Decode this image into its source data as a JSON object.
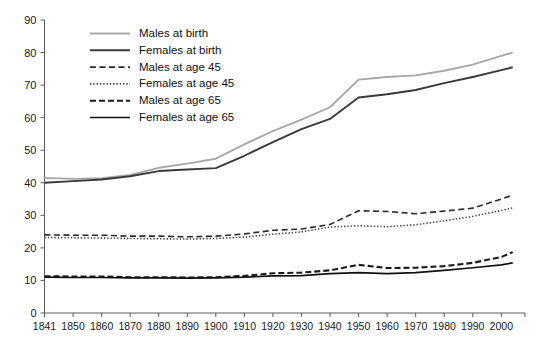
{
  "chart_data": {
    "type": "line",
    "title": "",
    "subtitle": "",
    "xlabel": "",
    "ylabel": "",
    "xlim": [
      1841,
      2004
    ],
    "ylim": [
      0,
      90
    ],
    "grid": false,
    "legend_position": "top-left",
    "x_tick_labels": [
      "1841",
      "1850",
      "1860",
      "1870",
      "1880",
      "1890",
      "1900",
      "1910",
      "1920",
      "1930",
      "1940",
      "1950",
      "1960",
      "1970",
      "1980",
      "1990",
      "2000"
    ],
    "x_ticks": [
      1841,
      1850,
      1860,
      1870,
      1880,
      1890,
      1900,
      1910,
      1920,
      1930,
      1940,
      1950,
      1960,
      1970,
      1980,
      1990,
      2000
    ],
    "y_tick_labels": [
      "0",
      "10",
      "20",
      "30",
      "40",
      "50",
      "60",
      "70",
      "80",
      "90"
    ],
    "y_ticks": [
      0,
      10,
      20,
      30,
      40,
      50,
      60,
      70,
      80,
      90
    ],
    "x": [
      1841,
      1850,
      1860,
      1870,
      1880,
      1890,
      1900,
      1910,
      1920,
      1930,
      1940,
      1950,
      1960,
      1970,
      1980,
      1990,
      2000,
      2004
    ],
    "series": [
      {
        "name": "Males at birth",
        "style": "solid",
        "color": "#a8a8a8",
        "width": 1.9,
        "values": [
          41.5,
          41.2,
          41.4,
          42.4,
          44.6,
          45.9,
          47.4,
          51.8,
          55.9,
          59.4,
          63.2,
          71.7,
          72.5,
          73.0,
          74.4,
          76.3,
          79.0,
          80.0
        ]
      },
      {
        "name": "Females at birth",
        "style": "solid",
        "color": "#3a3a3a",
        "width": 1.9,
        "values": [
          40.0,
          40.5,
          41.0,
          42.0,
          43.6,
          44.1,
          44.5,
          48.3,
          52.5,
          56.5,
          59.6,
          66.2,
          67.2,
          68.5,
          70.6,
          72.5,
          74.6,
          75.5
        ]
      },
      {
        "name": "Males at age 45",
        "style": "dashed",
        "color": "#2b2b2b",
        "width": 1.6,
        "values": [
          24.0,
          23.9,
          23.9,
          23.6,
          23.6,
          23.4,
          23.6,
          24.3,
          25.4,
          25.8,
          27.2,
          31.4,
          31.2,
          30.5,
          31.3,
          32.2,
          35.0,
          36.2
        ]
      },
      {
        "name": "Females at age 45",
        "style": "dotted",
        "color": "#4a4a4a",
        "width": 1.6,
        "values": [
          23.2,
          23.1,
          23.0,
          22.9,
          22.8,
          22.7,
          22.9,
          23.3,
          24.2,
          24.9,
          26.4,
          26.8,
          26.5,
          27.1,
          28.3,
          29.7,
          31.5,
          32.3
        ]
      },
      {
        "name": "Males at age 65",
        "style": "dashed-bold",
        "color": "#1c1c1c",
        "width": 2.1,
        "values": [
          11.3,
          11.2,
          11.2,
          11.0,
          11.0,
          10.9,
          11.0,
          11.4,
          12.2,
          12.4,
          13.1,
          14.8,
          13.8,
          13.9,
          14.4,
          15.4,
          17.2,
          18.7
        ]
      },
      {
        "name": "Females at age 65",
        "style": "solid",
        "color": "#111111",
        "width": 1.7,
        "values": [
          11.0,
          10.9,
          10.9,
          10.8,
          10.8,
          10.7,
          10.8,
          11.0,
          11.4,
          11.5,
          12.1,
          12.4,
          12.1,
          12.4,
          13.1,
          13.9,
          14.8,
          15.4
        ]
      }
    ]
  },
  "legend": {
    "items": [
      {
        "label": "Males at birth"
      },
      {
        "label": "Females at birth"
      },
      {
        "label": "Males at age 45"
      },
      {
        "label": "Females at age 45"
      },
      {
        "label": "Males at age 65"
      },
      {
        "label": "Females at age 65"
      }
    ]
  }
}
